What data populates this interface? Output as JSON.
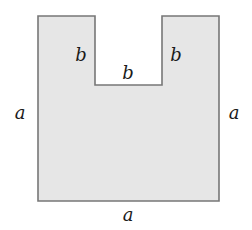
{
  "diagram": {
    "colors": {
      "fill": "#e6e6e6",
      "stroke": "#777777",
      "text": "#1a1a1a"
    },
    "labels": {
      "left_side": "a",
      "right_side": "a",
      "bottom_side": "a",
      "notch_left": "b",
      "notch_bottom": "b",
      "notch_right": "b"
    }
  }
}
